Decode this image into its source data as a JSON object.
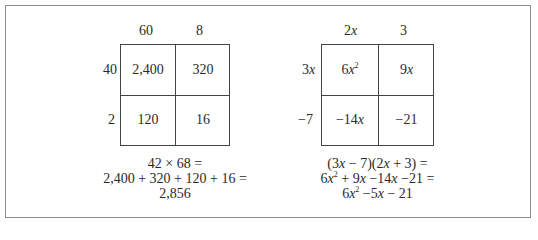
{
  "numeric_model": {
    "column_headers": [
      "60",
      "8"
    ],
    "row_headers": [
      "40",
      "2"
    ],
    "cells": [
      [
        "2,400",
        "320"
      ],
      [
        "120",
        "16"
      ]
    ],
    "equation_lines": [
      "42 × 68 =",
      "2,400 + 320 + 120 + 16 =",
      "2,856"
    ]
  },
  "algebraic_model": {
    "column_headers": [
      {
        "coef": "2",
        "var": "x"
      },
      {
        "coef": "3",
        "var": ""
      }
    ],
    "row_headers": [
      {
        "coef": "3",
        "var": "x"
      },
      {
        "coef": "−7",
        "var": ""
      }
    ],
    "cells": [
      [
        {
          "coef": "6",
          "var": "x",
          "exp": "2"
        },
        {
          "coef": "9",
          "var": "x",
          "exp": ""
        }
      ],
      [
        {
          "coef": "−14",
          "var": "x",
          "exp": ""
        },
        {
          "coef": "−21",
          "var": "",
          "exp": ""
        }
      ]
    ],
    "equation_lines": [
      "(3x − 7)(2x + 3) =",
      "6x² + 9x −14x −21 =",
      "6x² −5x − 21"
    ]
  }
}
